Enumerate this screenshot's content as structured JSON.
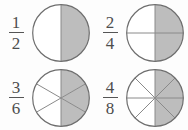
{
  "page": {
    "background_color": "#fdfdfd"
  },
  "style": {
    "shaded_fill": "#bdbdbd",
    "unshaded_fill": "#ffffff",
    "outline_color": "#6e6e6e",
    "divider_color": "#8a8a8a",
    "text_color": "#4d4d4d",
    "fraction_bar_color": "#555555"
  },
  "items": [
    {
      "id": "fraction-one-half",
      "numerator": "1",
      "denominator": "2",
      "fraction_label": "1/2",
      "total_parts": 2,
      "shaded_parts": 1,
      "shaded_fraction_value": 0.5,
      "row": 0,
      "column": 0
    },
    {
      "id": "fraction-two-fourths",
      "numerator": "2",
      "denominator": "4",
      "fraction_label": "2/4",
      "total_parts": 4,
      "shaded_parts": 2,
      "shaded_fraction_value": 0.5,
      "row": 0,
      "column": 1
    },
    {
      "id": "fraction-three-sixths",
      "numerator": "3",
      "denominator": "6",
      "fraction_label": "3/6",
      "total_parts": 6,
      "shaded_parts": 3,
      "shaded_fraction_value": 0.5,
      "row": 1,
      "column": 0
    },
    {
      "id": "fraction-four-eighths",
      "numerator": "4",
      "denominator": "8",
      "fraction_label": "4/8",
      "total_parts": 8,
      "shaded_parts": 4,
      "shaded_fraction_value": 0.5,
      "row": 1,
      "column": 1
    }
  ]
}
